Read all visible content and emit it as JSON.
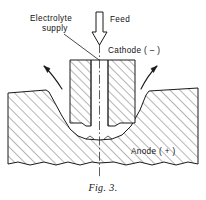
{
  "figure": {
    "caption": "Fig. 3."
  },
  "labels": {
    "electrolyte_line1": "Electrolyte",
    "electrolyte_line2": "supply",
    "feed": "Feed",
    "cathode": "Cathode ( – )",
    "anode": "Anode ( + )"
  },
  "icons": {
    "feed_arrow": "down-arrow-icon",
    "flow_left": "curved-flow-arrow-left-icon",
    "flow_right": "curved-flow-arrow-right-icon",
    "leader": "leader-line-icon",
    "centerline": "centerline-icon"
  },
  "colors": {
    "ink": "#1a1a1a",
    "paper": "#ffffff",
    "text": "#111111"
  }
}
